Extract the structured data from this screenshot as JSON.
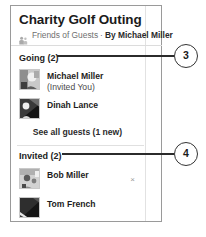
{
  "panel": {
    "title": "Charity Golf Outing",
    "subtitle": {
      "icon": "friends-icon",
      "audience": "Friends of Guests",
      "separator": "·",
      "by_label": "By Michael Miller"
    }
  },
  "sections": [
    {
      "id": "going",
      "heading": "Going (2)",
      "guests": [
        {
          "name": "Michael Miller",
          "note": " (Invited You)",
          "avatar": "photo-avatar-light",
          "removable": false
        },
        {
          "name": "Dinah Lance",
          "note": "",
          "avatar": "photo-avatar-dark",
          "removable": false
        }
      ],
      "link": "See all guests (1 new)"
    },
    {
      "id": "invited",
      "heading": "Invited (2)",
      "guests": [
        {
          "name": "Bob Miller",
          "note": "",
          "avatar": "photo-avatar-grain",
          "removable": true,
          "remove_glyph": "×"
        },
        {
          "name": "Tom French",
          "note": "",
          "avatar": "photo-avatar-dark2",
          "removable": false
        }
      ]
    }
  ],
  "callouts": [
    {
      "id": "3",
      "label": "3"
    },
    {
      "id": "4",
      "label": "4"
    }
  ],
  "colors": {
    "panel_border": "#9a9a9a",
    "divider": "#dcdcdc",
    "text_primary": "#1d1d1d",
    "text_muted": "#6f6f6f",
    "callout_stroke": "#333333"
  }
}
